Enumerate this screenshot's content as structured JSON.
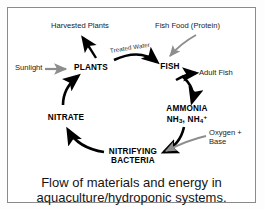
{
  "figure": {
    "caption_line1": "Flow of materials and energy in",
    "caption_line2": "aquaculture/hydroponic systems.",
    "frame_color": "#8a8a8a",
    "background_color": "#ffffff"
  },
  "diagram": {
    "title": "Flow of materials and energy in aquaculture/hydroponic systems.",
    "type": "cycle-diagram",
    "cycle_nodes": [
      {
        "id": "plants",
        "label": "PLANTS",
        "formula": ""
      },
      {
        "id": "fish",
        "label": "FISH",
        "formula": ""
      },
      {
        "id": "ammonia",
        "label": "AMMONIA",
        "formula": "NH3, NH4+"
      },
      {
        "id": "nitrifying-bacteria",
        "label_line1": "NITRIFYING",
        "label_line2": "BACTERIA",
        "formula": ""
      },
      {
        "id": "nitrate",
        "label": "NITRATE",
        "formula": ""
      }
    ],
    "external_labels": [
      {
        "id": "harvested-plants",
        "text": "Harvested Plants"
      },
      {
        "id": "fish-food",
        "text": "Fish Food (Protein)"
      },
      {
        "id": "sunlight",
        "text": "Sunlight"
      },
      {
        "id": "adult-fish",
        "text": "Adult Fish"
      },
      {
        "id": "oxygen-base-line1",
        "text": "Oxygen +"
      },
      {
        "id": "oxygen-base-line2",
        "text": "Base"
      }
    ],
    "arc_labels": [
      {
        "id": "treated-water",
        "text": "Treated Water"
      }
    ],
    "colors": {
      "cycle_arrow": "#000000",
      "input_arrow": "#8d8d8d",
      "output_arrow": "#000000",
      "text": "#000000"
    }
  }
}
